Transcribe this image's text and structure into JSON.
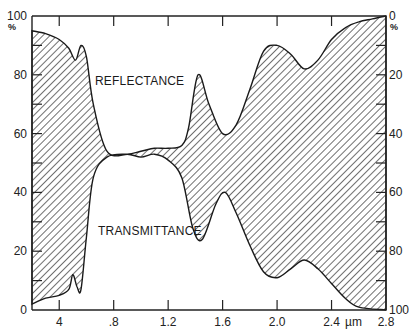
{
  "chart_data": {
    "type": "area",
    "title": "",
    "xlabel": "µm",
    "ylabel_left": "%",
    "ylabel_right": "%",
    "x_ticks": [
      "4",
      ".8",
      "1.2",
      "1.6",
      "2.0",
      "2.4",
      "2.8"
    ],
    "x_tick_values": [
      0.4,
      0.8,
      1.2,
      1.6,
      2.0,
      2.4,
      2.8
    ],
    "x_unit_label": "µm",
    "y_left_ticks": [
      "0",
      "20",
      "40",
      "60",
      "80",
      "100"
    ],
    "y_left_unit": "%",
    "y_right_ticks": [
      "100",
      "80",
      "60",
      "40",
      "20",
      "0"
    ],
    "y_right_unit": "%",
    "xlim": [
      0.2,
      2.8
    ],
    "ylim": [
      0,
      100
    ],
    "y_right_inverted": true,
    "grid": false,
    "annotations": [
      "REFLECTANCE",
      "TRANSMITTANCE"
    ],
    "series": [
      {
        "name": "Reflectance (upper boundary, % on left axis)",
        "x": [
          0.2,
          0.3,
          0.4,
          0.47,
          0.52,
          0.56,
          0.6,
          0.65,
          0.75,
          0.9,
          1.0,
          1.1,
          1.2,
          1.3,
          1.35,
          1.42,
          1.5,
          1.6,
          1.7,
          1.8,
          1.9,
          2.0,
          2.1,
          2.2,
          2.3,
          2.4,
          2.5,
          2.6,
          2.7,
          2.8
        ],
        "values": [
          95,
          94,
          92,
          89,
          85,
          90,
          86,
          70,
          54,
          53,
          54,
          55,
          55,
          56,
          62,
          80,
          70,
          60,
          63,
          75,
          88,
          90,
          87,
          82,
          85,
          92,
          96,
          98,
          99,
          100
        ]
      },
      {
        "name": "Transmittance boundary (% on left axis, 100-T)",
        "x": [
          0.2,
          0.3,
          0.4,
          0.47,
          0.5,
          0.53,
          0.56,
          0.6,
          0.65,
          0.75,
          0.9,
          1.0,
          1.1,
          1.2,
          1.3,
          1.38,
          1.45,
          1.55,
          1.62,
          1.7,
          1.8,
          1.9,
          2.0,
          2.1,
          2.2,
          2.3,
          2.4,
          2.5,
          2.6,
          2.8
        ],
        "values": [
          2,
          4,
          5,
          7,
          12,
          8,
          7,
          25,
          45,
          52,
          53,
          52,
          53,
          51,
          45,
          28,
          24,
          36,
          40,
          33,
          22,
          13,
          11,
          14,
          17,
          14,
          9,
          4,
          1,
          0
        ]
      }
    ]
  }
}
